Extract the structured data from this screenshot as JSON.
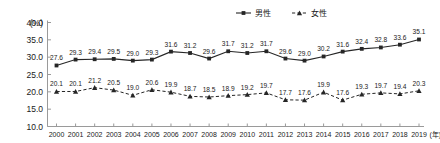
{
  "chart_data": {
    "type": "line",
    "title": "",
    "xlabel": "(年)",
    "ylabel": "(%)",
    "ylim": [
      10.0,
      40.0
    ],
    "yticks": [
      "10.0",
      "15.0",
      "20.0",
      "25.0",
      "30.0",
      "35.0",
      "40.0"
    ],
    "grid": false,
    "legend_position": "top-center",
    "categories": [
      "2000",
      "2001",
      "2002",
      "2003",
      "2004",
      "2005",
      "2006",
      "2007",
      "2008",
      "2009",
      "2010",
      "2011",
      "2012",
      "2013",
      "2014",
      "2015",
      "2016",
      "2017",
      "2018",
      "2019"
    ],
    "series": [
      {
        "name": "男性",
        "marker": "square",
        "linestyle": "solid",
        "color": "#262626",
        "values": [
          27.6,
          29.3,
          29.4,
          29.5,
          29.0,
          29.3,
          31.6,
          31.2,
          29.6,
          31.7,
          31.2,
          31.7,
          29.6,
          29.0,
          30.2,
          31.6,
          32.4,
          32.8,
          33.6,
          35.1
        ]
      },
      {
        "name": "女性",
        "marker": "triangle",
        "linestyle": "dashed",
        "color": "#262626",
        "values": [
          20.1,
          20.1,
          21.2,
          20.5,
          19.0,
          20.6,
          19.9,
          18.7,
          18.5,
          18.9,
          19.2,
          19.7,
          17.7,
          17.6,
          19.9,
          17.6,
          19.3,
          19.7,
          19.4,
          20.3
        ]
      }
    ]
  },
  "legend": {
    "male_label": "男性",
    "female_label": "女性"
  },
  "axes": {
    "y_unit": "(%)",
    "x_unit": "(年)"
  }
}
